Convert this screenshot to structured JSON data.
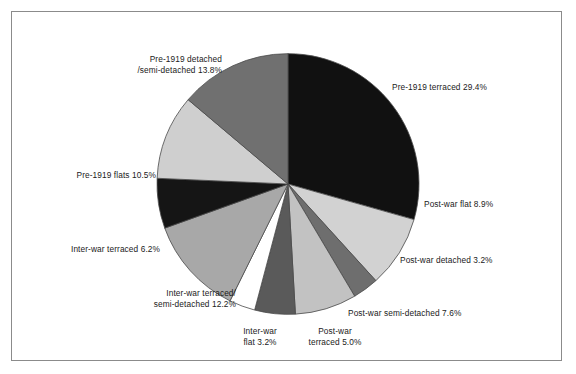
{
  "figure": {
    "background_color": "#ffffff",
    "frame_color": "#8b8b8b"
  },
  "chart_data": {
    "type": "pie",
    "title": "",
    "subtitle": "",
    "xlabel": "",
    "ylabel": "",
    "legend_position": "none",
    "grid": false,
    "start_angle_deg": 0,
    "direction": "clockwise",
    "units": "percent",
    "total": 100.0,
    "categories": [
      "Pre-1919 terraced",
      "Post-war flat",
      "Post-war detached",
      "Post-war semi-detached",
      "Post-war terraced",
      "Inter-war flat",
      "Inter-war terraced/semi-detached",
      "Inter-war terraced",
      "Pre-1919 flats",
      "Pre-1919 detached/semi-detached"
    ],
    "values": [
      29.4,
      8.9,
      3.2,
      7.6,
      5.0,
      3.2,
      12.2,
      6.2,
      10.5,
      13.8
    ],
    "slice_colors": [
      "#111111",
      "#d2d2d2",
      "#6e6e6e",
      "#c2c2c2",
      "#5a5a5a",
      "#ffffff",
      "#a8a8a8",
      "#151515",
      "#cfcfcf",
      "#707070"
    ],
    "slice_edge_color": "#4a4a4a",
    "labels": [
      {
        "key": "pre1919_terraced",
        "text": "Pre-1919 terraced 29.4%",
        "value": 29.4,
        "align": "left"
      },
      {
        "key": "postwar_flat",
        "text": "Post-war flat 8.9%",
        "value": 8.9,
        "align": "left"
      },
      {
        "key": "postwar_detached",
        "text": "Post-war detached 3.2%",
        "value": 3.2,
        "align": "left"
      },
      {
        "key": "postwar_semi_detached",
        "text": "Post-war semi-detached 7.6%",
        "value": 7.6,
        "align": "left"
      },
      {
        "key": "postwar_terraced",
        "text": "Post-war\nterraced 5.0%",
        "value": 5.0,
        "align": "center"
      },
      {
        "key": "interwar_flat",
        "text": "Inter-war\nflat 3.2%",
        "value": 3.2,
        "align": "center"
      },
      {
        "key": "interwar_terraced_semi",
        "text": "Inter-war terraced/\nsemi-detached 12.2%",
        "value": 12.2,
        "align": "left"
      },
      {
        "key": "interwar_terraced",
        "text": "Inter-war terraced 6.2%",
        "value": 6.2,
        "align": "right"
      },
      {
        "key": "pre1919_flats",
        "text": "Pre-1919 flats 10.5%",
        "value": 10.5,
        "align": "right"
      },
      {
        "key": "pre1919_detached_semi",
        "text": "Pre-1919 detached\n/semi-detached 13.8%",
        "value": 13.8,
        "align": "right"
      }
    ],
    "geometry": {
      "center_x": 288,
      "center_y": 184,
      "radius": 131
    }
  }
}
